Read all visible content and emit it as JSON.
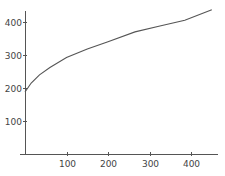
{
  "chart_data": {
    "type": "line",
    "title": "",
    "xlabel": "",
    "ylabel": "",
    "xlim": [
      0,
      460
    ],
    "ylim": [
      0,
      450
    ],
    "grid": false,
    "legend": null,
    "x_ticks": [
      100,
      200,
      300,
      400
    ],
    "y_ticks": [
      100,
      200,
      300,
      400
    ],
    "series": [
      {
        "name": "series-1",
        "color": "#555555",
        "x": [
          0,
          15,
          35,
          60,
          100,
          150,
          200,
          265,
          325,
          385,
          450
        ],
        "y": [
          188,
          215,
          240,
          262,
          292,
          318,
          340,
          370,
          388,
          405,
          437
        ]
      }
    ]
  },
  "layout": {
    "plot_left": 25,
    "plot_bottom": 154,
    "x_scale": 0.415,
    "y_scale": 0.33,
    "x_axis_start": 20,
    "x_axis_end": 218,
    "y_axis_top": 11
  }
}
